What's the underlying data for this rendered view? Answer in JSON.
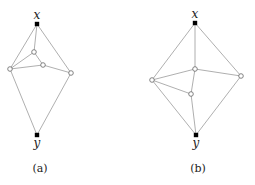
{
  "figures": [
    {
      "caption": "(a)",
      "caption_pos": [
        40,
        172
      ],
      "nodes": [
        {
          "id": "x",
          "label": "x",
          "x": 37,
          "y": 24,
          "type": "filled",
          "label_x": 37,
          "label_y": 19
        },
        {
          "id": "a1",
          "x": 34,
          "y": 52,
          "type": "open"
        },
        {
          "id": "a2",
          "x": 43,
          "y": 65,
          "type": "open"
        },
        {
          "id": "L",
          "x": 10,
          "y": 69,
          "type": "open"
        },
        {
          "id": "R",
          "x": 71,
          "y": 73,
          "type": "open"
        },
        {
          "id": "y",
          "label": "y",
          "x": 37,
          "y": 135,
          "type": "filled",
          "label_x": 37,
          "label_y": 147
        }
      ],
      "edges": [
        [
          "x",
          "L"
        ],
        [
          "x",
          "R"
        ],
        [
          "x",
          "a1"
        ],
        [
          "a1",
          "L"
        ],
        [
          "a1",
          "a2"
        ],
        [
          "a2",
          "L"
        ],
        [
          "a2",
          "R"
        ],
        [
          "L",
          "y"
        ],
        [
          "R",
          "y"
        ]
      ]
    },
    {
      "caption": "(b)",
      "caption_pos": [
        198,
        172
      ],
      "nodes": [
        {
          "id": "x",
          "label": "x",
          "x": 195,
          "y": 23,
          "type": "filled",
          "label_x": 195,
          "label_y": 18
        },
        {
          "id": "c",
          "x": 195,
          "y": 69,
          "type": "open"
        },
        {
          "id": "R",
          "x": 241,
          "y": 76,
          "type": "open"
        },
        {
          "id": "L",
          "x": 152,
          "y": 80,
          "type": "open"
        },
        {
          "id": "d",
          "x": 191,
          "y": 94,
          "type": "open"
        },
        {
          "id": "y",
          "label": "y",
          "x": 196,
          "y": 135,
          "type": "filled",
          "label_x": 196,
          "label_y": 147
        }
      ],
      "edges": [
        [
          "x",
          "L"
        ],
        [
          "x",
          "R"
        ],
        [
          "x",
          "c"
        ],
        [
          "c",
          "L"
        ],
        [
          "c",
          "R"
        ],
        [
          "c",
          "d"
        ],
        [
          "L",
          "d"
        ],
        [
          "L",
          "y"
        ],
        [
          "R",
          "y"
        ],
        [
          "d",
          "y"
        ]
      ]
    }
  ]
}
